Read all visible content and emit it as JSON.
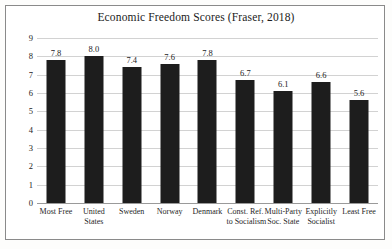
{
  "chart_data": {
    "type": "bar",
    "title": "Economic Freedom Scores (Fraser, 2018)",
    "xlabel": "",
    "ylabel": "Score",
    "ylim": [
      0,
      9
    ],
    "yticks": [
      "0",
      "1",
      "2",
      "3",
      "4",
      "5",
      "6",
      "7",
      "8",
      "9"
    ],
    "grid": true,
    "legend": "none",
    "bar_color": "#1d1d1d",
    "categories": [
      "Most Free",
      "United States",
      "Sweden",
      "Norway",
      "Denmark",
      "Const. Ref. to Socialism",
      "Multi-Party Soc. State",
      "Explicitly Socialist",
      "Least Free"
    ],
    "category_lines": [
      [
        "Most Free"
      ],
      [
        "United",
        "States"
      ],
      [
        "Sweden"
      ],
      [
        "Norway"
      ],
      [
        "Denmark"
      ],
      [
        "Const. Ref.",
        "to Socialism"
      ],
      [
        "Multi-Party",
        "Soc. State"
      ],
      [
        "Explicitly",
        "Socialist"
      ],
      [
        "Least Free"
      ]
    ],
    "values": [
      7.8,
      8.0,
      7.4,
      7.6,
      7.8,
      6.7,
      6.1,
      6.6,
      5.6
    ],
    "value_labels": [
      "7.8",
      "8.0",
      "7.4",
      "7.6",
      "7.8",
      "6.7",
      "6.1",
      "6.6",
      "5.6"
    ]
  }
}
